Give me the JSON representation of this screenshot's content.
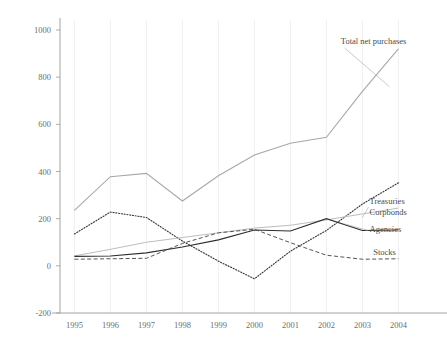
{
  "chart_data": {
    "type": "line",
    "title": "",
    "xlabel": "",
    "ylabel": "",
    "x": [
      1995,
      1996,
      1997,
      1998,
      1999,
      2000,
      2001,
      2002,
      2003,
      2004
    ],
    "categories": [
      "1995",
      "1996",
      "1997",
      "1998",
      "1999",
      "2000",
      "2001",
      "2002",
      "2003",
      "2004"
    ],
    "xlim": [
      1994.6,
      2004.6
    ],
    "ylim": [
      -200,
      1000
    ],
    "yticks": [
      -200,
      0,
      200,
      400,
      600,
      800,
      1000
    ],
    "ytick_labels": [
      "-200",
      "0",
      "200",
      "400",
      "600",
      "800",
      "1000"
    ],
    "grid": "vertical",
    "legend": "inline-annotations",
    "series": [
      {
        "name": "Total net purchases",
        "style": "solid-light",
        "color": "#a8a8a8",
        "label_x": 2002.4,
        "label_y": 940,
        "values": [
          235,
          378,
          392,
          275,
          382,
          470,
          520,
          545,
          740,
          920
        ]
      },
      {
        "name": "Treasuries",
        "style": "dotted",
        "color": "#3a3a3a",
        "label_x": 2003.2,
        "label_y": 262,
        "values": [
          135,
          228,
          205,
          105,
          20,
          -55,
          62,
          150,
          262,
          352
        ]
      },
      {
        "name": "Corpbonds",
        "style": "solid-light",
        "color": "#bdbdbd",
        "label_x": 2003.2,
        "label_y": 215,
        "values": [
          42,
          70,
          100,
          120,
          140,
          160,
          172,
          195,
          220,
          245
        ]
      },
      {
        "name": "Agencies",
        "style": "solid-dark",
        "color": "#2e2e2e",
        "label_x": 2003.2,
        "label_y": 142,
        "values": [
          40,
          42,
          55,
          80,
          110,
          152,
          148,
          200,
          150,
          152
        ]
      },
      {
        "name": "Stocks",
        "style": "dashed",
        "color": "#555555",
        "label_x": 2003.3,
        "label_y": 48,
        "values": [
          28,
          30,
          32,
          95,
          140,
          155,
          98,
          45,
          28,
          30
        ]
      }
    ]
  },
  "axes": {
    "y_ticks": [
      "1000",
      "800",
      "600",
      "400",
      "200",
      "0",
      "-200"
    ],
    "x_ticks": [
      "1995",
      "1996",
      "1997",
      "1998",
      "1999",
      "2000",
      "2001",
      "2002",
      "2003",
      "2004"
    ]
  },
  "annotations": {
    "total": "Total net purchases",
    "treasuries": "Treasuries",
    "corpbonds": "Corpbonds",
    "agencies": "Agencies",
    "stocks": "Stocks"
  }
}
